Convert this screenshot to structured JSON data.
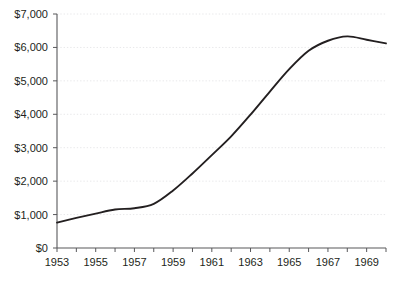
{
  "chart_data": {
    "type": "line",
    "title": "",
    "subtitle": "",
    "xlabel": "",
    "ylabel": "",
    "xlim": [
      1953,
      1970
    ],
    "ylim": [
      0,
      7000
    ],
    "grid": true,
    "legend": false,
    "legend_position": "none",
    "y_tick_labels": [
      "$7,000",
      "$6,000",
      "$5,000",
      "$4,000",
      "$3,000",
      "$2,000",
      "$1,000",
      "$0"
    ],
    "y_tick_values": [
      7000,
      6000,
      5000,
      4000,
      3000,
      2000,
      1000,
      0
    ],
    "x_tick_labels": [
      "1953",
      "1955",
      "1957",
      "1959",
      "1961",
      "1963",
      "1965",
      "1967",
      "1969"
    ],
    "x_tick_values": [
      1953,
      1955,
      1957,
      1959,
      1961,
      1963,
      1965,
      1967,
      1969
    ],
    "x_minor_tick_values": [
      1953,
      1954,
      1955,
      1956,
      1957,
      1958,
      1959,
      1960,
      1961,
      1962,
      1963,
      1964,
      1965,
      1966,
      1967,
      1968,
      1969,
      1970
    ],
    "series": [
      {
        "name": "value",
        "color": "#231f20",
        "x": [
          1953,
          1954,
          1955,
          1956,
          1957,
          1958,
          1959,
          1960,
          1961,
          1962,
          1963,
          1964,
          1965,
          1966,
          1967,
          1968,
          1969,
          1970
        ],
        "values": [
          760,
          900,
          1030,
          1150,
          1190,
          1320,
          1720,
          2230,
          2780,
          3340,
          3990,
          4680,
          5350,
          5900,
          6200,
          6330,
          6230,
          6120
        ]
      }
    ],
    "colors": {
      "line": "#231f20",
      "axis": "#58585b",
      "grid": "#e8e8ea",
      "text": "#231f20",
      "background": "#ffffff"
    }
  },
  "geometry": {
    "plot_left": 57,
    "plot_right": 386,
    "plot_top": 14,
    "plot_bottom": 248
  }
}
